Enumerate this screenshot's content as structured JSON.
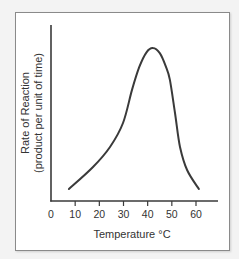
{
  "chart_data": {
    "type": "line",
    "title": "",
    "xlabel": "Temperature °C",
    "ylabel": "Rate of Reaction",
    "ylabel_sub": "(product per unit of time)",
    "x_ticks": [
      0,
      10,
      20,
      30,
      40,
      50,
      60
    ],
    "x_tick_labels": [
      "0",
      "10",
      "20",
      "30",
      "40",
      "50",
      "60"
    ],
    "xlim": [
      0,
      69
    ],
    "ylim": [
      0,
      100
    ],
    "y_ticks": [],
    "grid": false,
    "legend": null,
    "series": [
      {
        "name": "Rate of Reaction",
        "color": "#3a3a3a",
        "x": [
          7.4,
          17.4,
          24.4,
          29.8,
          33.5,
          36.5,
          39.5,
          42.2,
          45.0,
          47.5,
          49.2,
          51.3,
          53.4,
          56.3,
          61.2
        ],
        "y": [
          6.8,
          19.3,
          30.7,
          44.3,
          63.1,
          76.0,
          84.5,
          86.9,
          84.0,
          76.5,
          68.8,
          50.0,
          30.7,
          17.6,
          6.8
        ]
      }
    ],
    "annotations": [],
    "peak": {
      "x": 42,
      "label": "optimum temperature"
    }
  }
}
